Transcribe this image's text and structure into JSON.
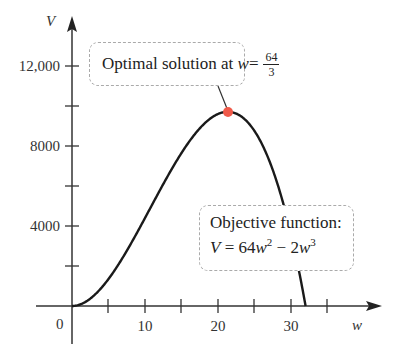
{
  "chart_data": {
    "type": "line",
    "title": "",
    "xlabel": "w",
    "ylabel": "V",
    "x_ticks": [
      0,
      10,
      20,
      30
    ],
    "x_minor_ticks": [
      5,
      15,
      25,
      35
    ],
    "y_ticks": [
      4000,
      8000,
      12000
    ],
    "y_minor_ticks": [
      2000,
      6000,
      10000
    ],
    "x_tick_labels": [
      "0",
      "10",
      "20",
      "30"
    ],
    "y_tick_labels": [
      "4000",
      "8000",
      "12,000"
    ],
    "xlim": [
      -5,
      42
    ],
    "ylim": [
      -1500,
      14000
    ],
    "grid": false,
    "series": [
      {
        "name": "Objective function: V = 64w^2 - 2w^3",
        "x": [
          0,
          2,
          4,
          6,
          8,
          10,
          12,
          14,
          16,
          18,
          20,
          21.33,
          22,
          24,
          26,
          28,
          30,
          32
        ],
        "values": [
          0,
          240,
          896,
          1872,
          3072,
          4400,
          5760,
          7056,
          8192,
          9072,
          9600,
          9709,
          9680,
          9216,
          8112,
          6272,
          3600,
          0
        ]
      }
    ],
    "annotations": [
      {
        "text": "Optimal solution at w = 64/3",
        "point": [
          21.33,
          9709
        ],
        "marker_color": "#f05a4a"
      },
      {
        "text": "Objective function: V = 64w^2 - 2w^3",
        "point": [
          31,
          1922
        ]
      }
    ]
  },
  "labels": {
    "y_axis": "V",
    "x_axis": "w",
    "origin": "0",
    "x10": "10",
    "x20": "20",
    "x30": "30",
    "y4000": "4000",
    "y8000": "8000",
    "y12000": "12,000",
    "optimal_prefix": "Optimal solution at ",
    "optimal_var": "w",
    "optimal_eq": " = ",
    "frac_num": "64",
    "frac_den": "3",
    "objective_title": "Objective function:",
    "obj_V": "V",
    "obj_eq": " = 64",
    "obj_w1": "w",
    "obj_exp1": "2",
    "obj_minus": " − 2",
    "obj_w2": "w",
    "obj_exp2": "3"
  }
}
